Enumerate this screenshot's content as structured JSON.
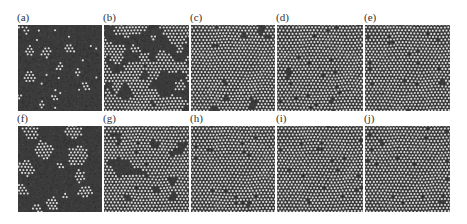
{
  "figure": {
    "colors": {
      "background": "#ffffff",
      "substrate": "#3b3b3b",
      "particle": "#dcdcdc",
      "label": "#333333"
    },
    "panels": [
      {
        "label": "(a)",
        "row": 0,
        "col": 0,
        "x": 18,
        "y": 25,
        "w": 84,
        "h": 86,
        "mode": "clusters",
        "clusters": [
          [
            8,
            6,
            5
          ],
          [
            12,
            26,
            5
          ],
          [
            28,
            27,
            5
          ],
          [
            52,
            24,
            5
          ],
          [
            42,
            42,
            4
          ],
          [
            12,
            52,
            6
          ],
          [
            60,
            48,
            3
          ],
          [
            67,
            62,
            4
          ],
          [
            36,
            74,
            3
          ],
          [
            24,
            80,
            3
          ],
          [
            2,
            72,
            3
          ]
        ],
        "noise": 0.02
      },
      {
        "label": "(b)",
        "row": 0,
        "col": 1,
        "x": 104,
        "y": 25,
        "w": 85,
        "h": 86,
        "mode": "dense",
        "fill": 0.62
      },
      {
        "label": "(c)",
        "row": 0,
        "col": 2,
        "x": 191,
        "y": 25,
        "w": 84,
        "h": 86,
        "mode": "dense",
        "fill": 0.88
      },
      {
        "label": "(d)",
        "row": 0,
        "col": 3,
        "x": 277,
        "y": 25,
        "w": 86,
        "h": 86,
        "mode": "dense",
        "fill": 0.92
      },
      {
        "label": "(e)",
        "row": 0,
        "col": 4,
        "x": 365,
        "y": 25,
        "w": 85,
        "h": 86,
        "mode": "dense",
        "fill": 0.94
      },
      {
        "label": "(f)",
        "row": 1,
        "col": 0,
        "x": 18,
        "y": 126,
        "w": 84,
        "h": 86,
        "mode": "clusters",
        "clusters": [
          [
            12,
            6,
            8
          ],
          [
            56,
            6,
            8
          ],
          [
            26,
            24,
            9
          ],
          [
            60,
            30,
            10
          ],
          [
            8,
            42,
            8
          ],
          [
            62,
            50,
            6
          ],
          [
            42,
            40,
            4
          ],
          [
            68,
            66,
            7
          ],
          [
            4,
            64,
            6
          ],
          [
            34,
            78,
            7
          ],
          [
            20,
            82,
            5
          ],
          [
            48,
            70,
            3
          ]
        ],
        "noise": 0.0
      },
      {
        "label": "(g)",
        "row": 1,
        "col": 1,
        "x": 104,
        "y": 126,
        "w": 85,
        "h": 86,
        "mode": "dense",
        "fill": 0.78
      },
      {
        "label": "(h)",
        "row": 1,
        "col": 2,
        "x": 191,
        "y": 126,
        "w": 84,
        "h": 86,
        "mode": "dense",
        "fill": 0.96
      },
      {
        "label": "(i)",
        "row": 1,
        "col": 3,
        "x": 277,
        "y": 126,
        "w": 86,
        "h": 86,
        "mode": "dense",
        "fill": 0.98
      },
      {
        "label": "(j)",
        "row": 1,
        "col": 4,
        "x": 365,
        "y": 126,
        "w": 85,
        "h": 86,
        "mode": "dense",
        "fill": 0.985
      }
    ],
    "particle_spacing": 3.4,
    "particle_radius": 1.05
  }
}
